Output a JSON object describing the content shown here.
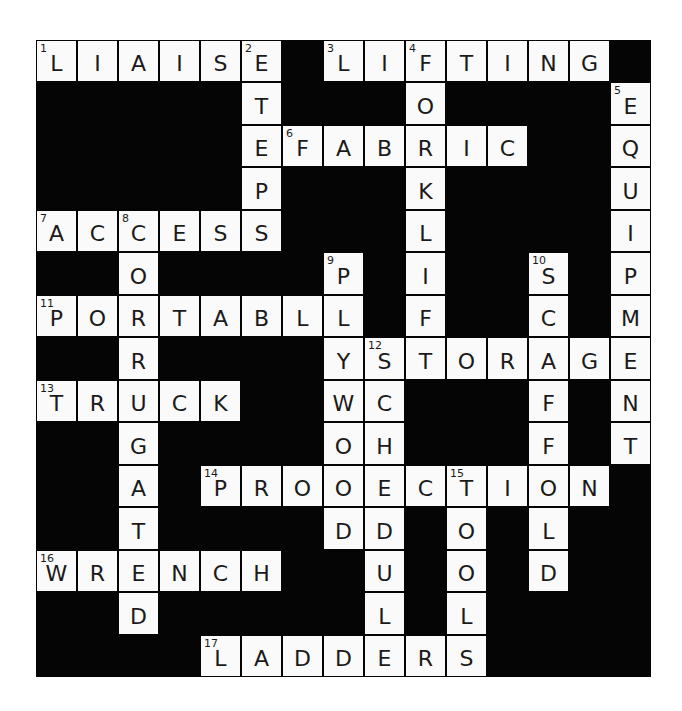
{
  "puzzle": {
    "cols": 15,
    "rows": 15,
    "colors": {
      "block": "#050505",
      "cell": "#fafafa",
      "text": "#1a1a1a"
    },
    "words": [
      {
        "number": 1,
        "answer": "LIAISE",
        "direction": "across",
        "row": 0,
        "col": 0
      },
      {
        "number": 2,
        "answer": "STEPS",
        "direction": "down",
        "row": 0,
        "col": 5
      },
      {
        "number": 3,
        "answer": "LIFTING",
        "direction": "across",
        "row": 0,
        "col": 7
      },
      {
        "number": 4,
        "answer": "FORKLIFT",
        "direction": "down",
        "row": 0,
        "col": 9
      },
      {
        "number": 5,
        "answer": "EQUIPMENT",
        "direction": "down",
        "row": 1,
        "col": 14
      },
      {
        "number": 6,
        "answer": "FABRIC",
        "direction": "across",
        "row": 2,
        "col": 6
      },
      {
        "number": 7,
        "answer": "ACCESS",
        "direction": "across",
        "row": 4,
        "col": 0
      },
      {
        "number": 8,
        "answer": "CORRUGATED",
        "direction": "down",
        "row": 4,
        "col": 2
      },
      {
        "number": 9,
        "answer": "PLYWOOD",
        "direction": "down",
        "row": 5,
        "col": 7
      },
      {
        "number": 10,
        "answer": "SCAFFOLD",
        "direction": "down",
        "row": 5,
        "col": 12
      },
      {
        "number": 11,
        "answer": "PORTABLE",
        "direction": "across",
        "row": 6,
        "col": 0
      },
      {
        "number": 12,
        "answer": "STORAGE",
        "direction": "across",
        "row": 7,
        "col": 8
      },
      {
        "number": 12,
        "answer": "SCHEDULE",
        "direction": "down",
        "row": 7,
        "col": 8
      },
      {
        "number": 13,
        "answer": "TRUCK",
        "direction": "across",
        "row": 8,
        "col": 0
      },
      {
        "number": 14,
        "answer": "PROTECTION",
        "direction": "across",
        "row": 10,
        "col": 4
      },
      {
        "number": 15,
        "answer": "TOOLS",
        "direction": "down",
        "row": 10,
        "col": 10
      },
      {
        "number": 16,
        "answer": "WRENCH",
        "direction": "across",
        "row": 12,
        "col": 0
      },
      {
        "number": 17,
        "answer": "LADDERS",
        "direction": "across",
        "row": 14,
        "col": 4
      }
    ]
  }
}
